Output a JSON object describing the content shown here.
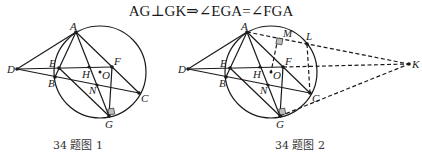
{
  "formula": "AG⊥GK⇒∠EGA=∠FGA",
  "figures": [
    {
      "caption": "34 题图 1",
      "labels": {
        "A": "A",
        "B": "B",
        "C": "C",
        "D": "D",
        "E": "E",
        "F": "F",
        "G": "G",
        "H": "H",
        "N": "N",
        "O": "O"
      }
    },
    {
      "caption": "34 题图 2",
      "labels": {
        "A": "A",
        "B": "B",
        "C": "C",
        "D": "D",
        "E": "E",
        "F": "F",
        "G": "G",
        "H": "H",
        "N": "N",
        "O": "O",
        "M": "M",
        "L": "L",
        "K": "K"
      }
    }
  ]
}
